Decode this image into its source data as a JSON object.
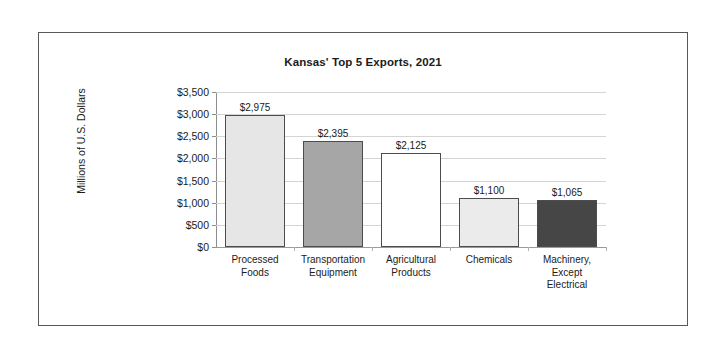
{
  "chart_data": {
    "type": "bar",
    "title": "Kansas' Top 5 Exports, 2021",
    "xlabel": "",
    "ylabel": "Millions of U.S. Dollars",
    "ylim": [
      0,
      3500
    ],
    "ytick_step": 500,
    "grid": true,
    "legend": false,
    "categories": [
      "Processed\nFoods",
      "Transportation\nEquipment",
      "Agricultural\nProducts",
      "Chemicals",
      "Machinery,\nExcept\nElectrical"
    ],
    "values": [
      2975,
      2395,
      2125,
      1100,
      1065
    ],
    "data_labels": [
      "$2,975",
      "$2,395",
      "$2,125",
      "$1,100",
      "$1,065"
    ],
    "ytick_labels": [
      "$3,500",
      "$3,000",
      "$2,500",
      "$2,000",
      "$1,500",
      "$1,000",
      "$500",
      "$0"
    ],
    "ytick_values": [
      3500,
      3000,
      2500,
      2000,
      1500,
      1000,
      500,
      0
    ],
    "bar_colors": [
      "#e6e6e6",
      "#a6a6a6",
      "#ffffff",
      "#ebebeb",
      "#464646"
    ],
    "bar_border_color": "#4c4c4c",
    "gridline_color": "#d4d4d4",
    "axis_color": "#8d8d8d",
    "frame_color": "#58585a",
    "background_color": "#ffffff",
    "text_color": "#1b1b1b"
  },
  "categories_flat": [
    "Processed Foods",
    "Transportation Equipment",
    "Agricultural Products",
    "Chemicals",
    "Machinery, Except Electrical"
  ]
}
